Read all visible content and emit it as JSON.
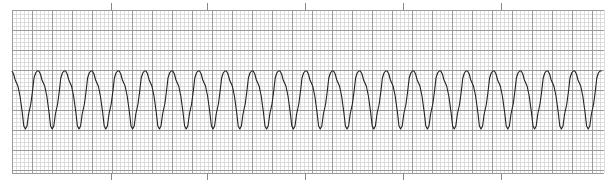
{
  "chart_data": {
    "type": "line",
    "title": "",
    "subtitle": "",
    "xlabel": "",
    "ylabel": "",
    "grid": {
      "on": true,
      "minor_spacing_px": 4,
      "major_spacing_px": 20,
      "minor_color": "#d4d4d4",
      "major_color": "#9a9a9a",
      "left": 12,
      "top": 10,
      "right": 604,
      "bottom": 173
    },
    "time_markers_x": [
      111,
      207,
      305,
      403,
      501
    ],
    "trace": {
      "color": "#222222",
      "start_x": 12,
      "end_x": 602,
      "period_px": 26.8,
      "baseline_peak_y": 71,
      "trough_y": 129,
      "cycle_count": 22,
      "cycle_shape": [
        [
          0.0,
          71
        ],
        [
          0.06,
          74
        ],
        [
          0.12,
          80
        ],
        [
          0.22,
          86
        ],
        [
          0.3,
          96
        ],
        [
          0.38,
          112
        ],
        [
          0.44,
          126
        ],
        [
          0.5,
          129
        ],
        [
          0.56,
          126
        ],
        [
          0.62,
          114
        ],
        [
          0.7,
          104
        ],
        [
          0.76,
          92
        ],
        [
          0.82,
          78
        ],
        [
          0.88,
          73
        ],
        [
          0.94,
          71
        ],
        [
          1.0,
          71
        ]
      ]
    },
    "estimated_rate_bpm": 225,
    "rhythm": "regular"
  }
}
